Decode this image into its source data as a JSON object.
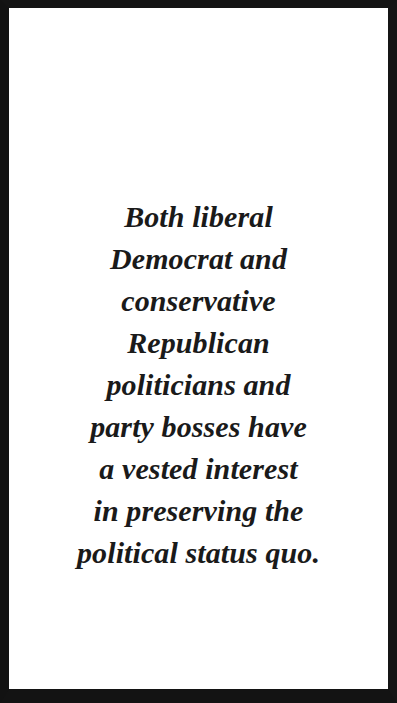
{
  "page": {
    "background_color": "#ffffff",
    "frame_color": "#121212",
    "text_color": "#1a1a1a"
  },
  "quote": {
    "full_text": "Both liberal Democrat and conservative Republican politicians and party bosses have a vested interest in preserving the political status quo.",
    "lines": [
      "Both liberal",
      "Democrat and",
      "conservative",
      "Republican",
      "politicians and",
      "party bosses have",
      "a vested interest",
      "in preserving the",
      "political status quo."
    ]
  }
}
